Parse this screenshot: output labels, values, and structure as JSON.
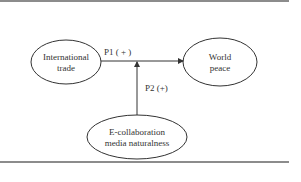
{
  "diagram": {
    "nodes": [
      {
        "id": "trade",
        "lines": [
          "International",
          "trade"
        ]
      },
      {
        "id": "peace",
        "lines": [
          "World",
          "peace"
        ]
      },
      {
        "id": "ecollab",
        "lines": [
          "E-collaboration",
          "media naturalness"
        ]
      }
    ],
    "edges": [
      {
        "id": "p1",
        "from": "trade",
        "to": "peace",
        "label": "P1 ( + )"
      },
      {
        "id": "p2",
        "from": "ecollab",
        "to": "p1",
        "label": "P2 (+)"
      }
    ],
    "colors": {
      "stroke": "#333333",
      "rule": "#666666",
      "background": "#ffffff"
    }
  }
}
